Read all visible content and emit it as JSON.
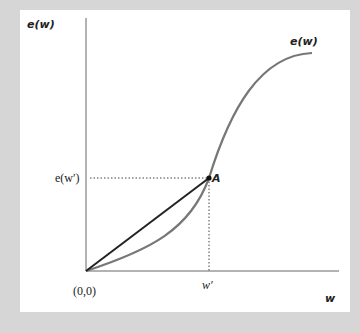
{
  "diagram": {
    "y_axis_label": "e(w)",
    "x_axis_label": "w",
    "curve_label": "e(w)",
    "point_label": "A",
    "y_tick_label": "e(w′)",
    "x_tick_label": "w′",
    "origin_label": "(0,0)",
    "colors": {
      "curve": "#777777",
      "chord": "#222222",
      "axes": "#555555",
      "background": "#d6d6d6",
      "panel": "#ffffff"
    }
  }
}
